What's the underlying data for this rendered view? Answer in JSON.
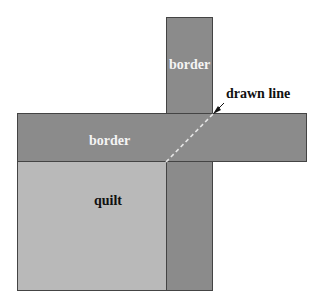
{
  "labels": {
    "border_vertical": "border",
    "border_horizontal": "border",
    "quilt": "quilt",
    "drawn_line": "drawn line"
  },
  "colors": {
    "border": "#8b8b8b",
    "quilt": "#b9b9b9",
    "dashed_line": "#e6e6e6"
  }
}
